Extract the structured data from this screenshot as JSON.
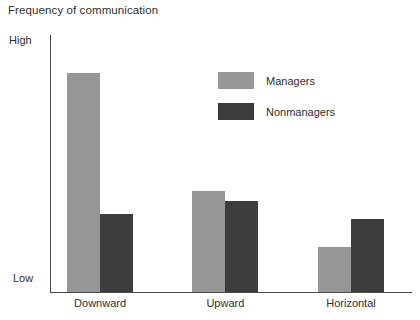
{
  "chart_data": {
    "type": "bar",
    "title": "Frequency of communication",
    "xlabel": "",
    "ylabel": "",
    "categories": [
      "Downward",
      "Upward",
      "Horizontal"
    ],
    "series": [
      {
        "name": "Managers",
        "color": "#969696",
        "values": [
          0.87,
          0.4,
          0.18
        ]
      },
      {
        "name": "Nonmanagers",
        "color": "#3d3d3d",
        "values": [
          0.31,
          0.36,
          0.29
        ]
      }
    ],
    "ylim": [
      0,
      1
    ],
    "ytick_labels": [
      "Low",
      "High"
    ],
    "grid": false,
    "legend_position": "upper-center"
  },
  "layout": {
    "group_centers_pct": [
      13.6,
      48.3,
      83.1
    ],
    "bar_width_px": 33,
    "axis_color": "#4a4a4a"
  }
}
